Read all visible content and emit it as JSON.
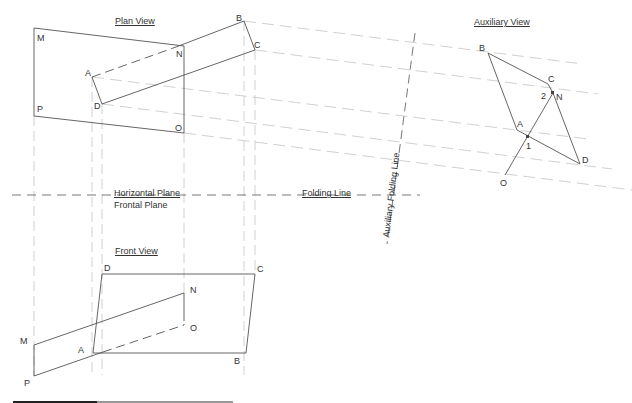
{
  "titles": {
    "plan_view": "Plan View",
    "auxiliary_view": "Auxiliary View",
    "front_view": "Front View"
  },
  "planes": {
    "horizontal": "Horizontal Plane",
    "frontal": "Frontal Plane",
    "folding_line": "Folding Line",
    "auxiliary_folding_line": "Auxiliary Folding Line"
  },
  "plan_labels": {
    "M": "M",
    "N": "N",
    "O": "O",
    "P": "P",
    "A": "A",
    "B": "B",
    "C": "C",
    "D": "D"
  },
  "front_labels": {
    "M": "M",
    "N": "N",
    "O": "O",
    "P": "P",
    "A": "A",
    "B": "B",
    "C": "C",
    "D": "D"
  },
  "aux_labels": {
    "A": "A",
    "B": "B",
    "C": "C",
    "D": "D",
    "N": "N",
    "O": "O",
    "p1": "1",
    "p2": "2"
  },
  "colors": {
    "line": "#555555",
    "construction": "#bbbbbb",
    "text": "#333333"
  },
  "geometry": {
    "plan": {
      "plane_MNOP": [
        [
          34,
          28
        ],
        [
          184,
          46
        ],
        [
          184,
          133
        ],
        [
          34,
          116
        ]
      ],
      "plane_ABCD": {
        "A": [
          92,
          77
        ],
        "B": [
          244,
          21
        ],
        "C": [
          255,
          50
        ],
        "D": [
          102,
          104
        ]
      }
    },
    "front": {
      "plane_ABCD": {
        "A": [
          93,
          353
        ],
        "B": [
          246,
          353
        ],
        "C": [
          255,
          274
        ],
        "D": [
          102,
          274
        ]
      },
      "plane_MNOP": {
        "M": [
          34,
          345
        ],
        "N": [
          184,
          293
        ],
        "O": [
          184,
          325
        ],
        "P": [
          34,
          376
        ]
      }
    },
    "auxiliary": {
      "A": [
        517,
        130
      ],
      "B": [
        488,
        53
      ],
      "C": [
        551,
        86
      ],
      "D": [
        580,
        164
      ],
      "N": [
        553,
        93
      ],
      "O": [
        505,
        175
      ],
      "p1": [
        528,
        137
      ]
    }
  }
}
